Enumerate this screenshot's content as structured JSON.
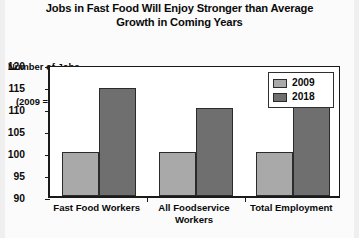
{
  "title": "Jobs in Fast Food Will Enjoy Stronger than Average Growth in Coming Years",
  "title_line1": "Jobs in Fast Food Will Enjoy Stronger than Average",
  "title_line2": "Growth in Coming Years",
  "axis_caption_line1": "Number of Jobs",
  "axis_caption_line2": "(2009 = 100)",
  "legend": {
    "items": [
      {
        "label": "2009",
        "color": "#a9a9a9"
      },
      {
        "label": "2018",
        "color": "#6f6f6f"
      }
    ]
  },
  "chart_data": {
    "type": "bar",
    "title": "Jobs in Fast Food Will Enjoy Stronger than Average Growth in Coming Years",
    "subtitle": "",
    "xlabel": "",
    "ylabel": "Number of Jobs (2009 = 100)",
    "categories": [
      "Fast Food Workers",
      "All Foodservice Workers",
      "Total Employment"
    ],
    "category_lines": [
      [
        "Fast Food Workers"
      ],
      [
        "All Foodservice",
        "Workers"
      ],
      [
        "Total Employment"
      ]
    ],
    "series": [
      {
        "name": "2009",
        "color": "#a9a9a9",
        "values": [
          100,
          100,
          100
        ]
      },
      {
        "name": "2018",
        "color": "#6f6f6f",
        "values": [
          114.5,
          110,
          110.5
        ]
      }
    ],
    "ylim": [
      90,
      120
    ],
    "yticks": [
      90,
      95,
      100,
      105,
      110,
      115,
      120
    ],
    "ytick_labels": [
      "90",
      "95",
      "100",
      "105",
      "110",
      "115",
      "120"
    ],
    "grid": false,
    "legend_position": "upper right"
  }
}
